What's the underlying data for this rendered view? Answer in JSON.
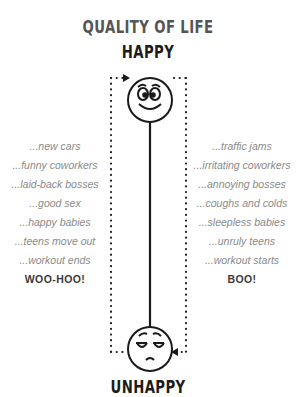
{
  "title": "QUALITY OF LIFE",
  "top_label": "HAPPY",
  "bottom_label": "UNHAPPY",
  "icons": {
    "top": "happy-face-icon",
    "bottom": "unhappy-face-icon"
  },
  "left_column": {
    "items": [
      "...new cars",
      "...funny coworkers",
      "...laid-back bosses",
      "...good sex",
      "...happy babies",
      "...teens move out",
      "...workout ends"
    ],
    "exclamation": "WOO-HOO!"
  },
  "right_column": {
    "items": [
      "...traffic jams",
      "...irritating coworkers",
      "...annoying bosses",
      "...coughs and colds",
      "...sleepless babies",
      "...unruly teens",
      "...workout starts"
    ],
    "exclamation": "BOO!"
  },
  "colors": {
    "line": "#1a1a1a",
    "title": "#555555",
    "item_text": "#8a8a8a"
  }
}
